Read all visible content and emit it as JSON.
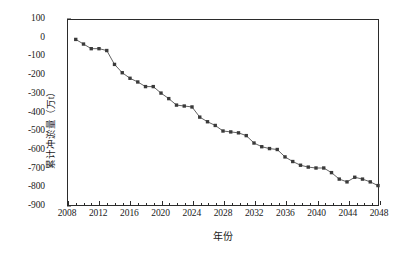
{
  "chart_data": {
    "type": "line",
    "title": "",
    "xlabel": "年份",
    "ylabel": "累计冲淤量（万t）",
    "xlim": [
      2008,
      2048
    ],
    "ylim": [
      -900,
      100
    ],
    "xticks": [
      2008,
      2012,
      2016,
      2020,
      2024,
      2028,
      2032,
      2036,
      2040,
      2044,
      2048
    ],
    "yticks": [
      100,
      0,
      -100,
      -200,
      -300,
      -400,
      -500,
      -600,
      -700,
      -800,
      -900
    ],
    "xtick_labels": [
      "2008",
      "2012",
      "2016",
      "2020",
      "2024",
      "2028",
      "2032",
      "2036",
      "2040",
      "2044",
      "2048"
    ],
    "ytick_labels": [
      "100",
      "0",
      "-100",
      "-200",
      "-300",
      "-400",
      "-500",
      "-600",
      "-700",
      "-800",
      "-900"
    ],
    "grid": false,
    "legend": null,
    "marker": "square",
    "line_color": "#3a3a3a",
    "marker_color": "#3a3a3a",
    "x": [
      2009,
      2010,
      2011,
      2012,
      2013,
      2014,
      2015,
      2016,
      2017,
      2018,
      2019,
      2020,
      2021,
      2022,
      2023,
      2024,
      2025,
      2026,
      2027,
      2028,
      2029,
      2030,
      2031,
      2032,
      2033,
      2034,
      2035,
      2036,
      2037,
      2038,
      2039,
      2040,
      2041,
      2042,
      2043,
      2044,
      2045,
      2046,
      2047,
      2048
    ],
    "values": [
      -5,
      -30,
      -55,
      -55,
      -65,
      -140,
      -185,
      -215,
      -235,
      -260,
      -260,
      -295,
      -325,
      -360,
      -365,
      -370,
      -425,
      -450,
      -470,
      -500,
      -505,
      -510,
      -525,
      -565,
      -585,
      -595,
      -600,
      -640,
      -665,
      -685,
      -695,
      -700,
      -700,
      -725,
      -760,
      -775,
      -750,
      -760,
      -775,
      -795
    ],
    "series": [
      {
        "name": "累计冲淤量",
        "values": [
          -5,
          -30,
          -55,
          -55,
          -65,
          -140,
          -185,
          -215,
          -235,
          -260,
          -260,
          -295,
          -325,
          -360,
          -365,
          -370,
          -425,
          -450,
          -470,
          -500,
          -505,
          -510,
          -525,
          -565,
          -585,
          -595,
          -600,
          -640,
          -665,
          -685,
          -695,
          -700,
          -700,
          -725,
          -760,
          -775,
          -750,
          -760,
          -775,
          -795
        ]
      }
    ]
  }
}
